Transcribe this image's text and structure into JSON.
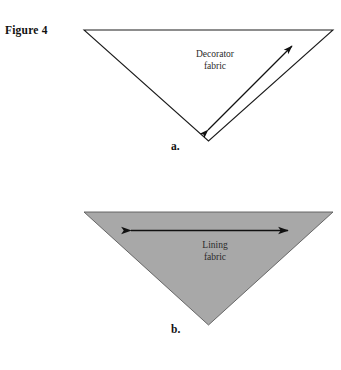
{
  "figure": {
    "label": "Figure 4"
  },
  "panels": [
    {
      "id": "panel-a",
      "caption": "a.",
      "fabric_label_line1": "Decorator",
      "fabric_label_line2": "fabric",
      "fill": "#ffffff",
      "stroke": "#1a1a1a",
      "arrow": "diagonal double-headed arrow",
      "shape": "inverted triangle"
    },
    {
      "id": "panel-b",
      "caption": "b.",
      "fabric_label_line1": "Lining",
      "fabric_label_line2": "fabric",
      "fill": "#a8a8a8",
      "stroke": "#4a4a4a",
      "arrow": "horizontal double-headed arrow",
      "shape": "inverted triangle"
    }
  ],
  "icons": {
    "arrow_double_diagonal": "arrow-double-diagonal-icon",
    "arrow_double_horizontal": "arrow-double-horizontal-icon",
    "triangle_outline": "triangle-outline-icon",
    "triangle_filled": "triangle-filled-icon"
  },
  "colors": {
    "page_background": "#ffffff",
    "lining_gray": "#a8a8a8",
    "ink": "#1a1a1a",
    "text": "#2b2b2b"
  }
}
